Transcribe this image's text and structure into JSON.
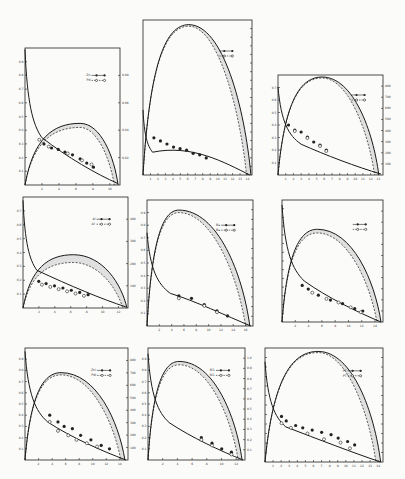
{
  "figure": {
    "background": "#fbfbf9",
    "ink": "#1a1a1a",
    "band_color": "#d9d9d9"
  },
  "chart_data": [
    {
      "id": "p1",
      "type": "line",
      "box": {
        "x": 25,
        "y": 48,
        "w": 95,
        "h": 137
      },
      "legend": [
        {
          "marker": "filled",
          "label": "Zn —●—●"
        },
        {
          "marker": "open",
          "label": "Pd —○—○"
        }
      ],
      "x_ticks": [
        "2",
        "4",
        "6",
        "8",
        "10"
      ],
      "left_ticks": [
        "0.1",
        "0.2",
        "0.3",
        "0.4",
        "0.5",
        "0.6",
        "0.7",
        "0.8",
        "0.9"
      ],
      "right_ticks": [
        "0.02",
        "0.04",
        "0.06",
        "0.08"
      ],
      "peak_curve": {
        "peak_x": 0.58,
        "peak_y": 0.45,
        "dash_peak_y": 0.42,
        "end_x": 0.98
      },
      "decay_curve": {
        "start_y": 0.99,
        "knee": 0.08,
        "end_y": 0.01
      },
      "points_filled": [
        [
          0.2,
          0.3
        ],
        [
          0.28,
          0.27
        ],
        [
          0.35,
          0.26
        ],
        [
          0.42,
          0.24
        ],
        [
          0.5,
          0.22
        ],
        [
          0.58,
          0.19
        ],
        [
          0.65,
          0.16
        ],
        [
          0.72,
          0.13
        ]
      ],
      "points_open": [
        [
          0.15,
          0.33
        ],
        [
          0.25,
          0.28
        ],
        [
          0.45,
          0.23
        ],
        [
          0.6,
          0.18
        ],
        [
          0.7,
          0.15
        ]
      ]
    },
    {
      "id": "p2",
      "type": "line",
      "box": {
        "x": 143,
        "y": 20,
        "w": 109,
        "h": 155
      },
      "legend": [
        {
          "marker": "filled",
          "label": "—●"
        },
        {
          "marker": "open",
          "label": "—●"
        }
      ],
      "x_ticks": [
        "1",
        "2",
        "3",
        "4",
        "5",
        "6",
        "7",
        "8",
        "9",
        "10",
        "11",
        "12",
        "13",
        "14"
      ],
      "left_ticks": [],
      "right_ticks": [
        "",
        "",
        "",
        "",
        "",
        "",
        "",
        "",
        "",
        "",
        "",
        "",
        "",
        "",
        "",
        "",
        ""
      ],
      "peak_curve": {
        "peak_x": 0.42,
        "peak_y": 0.97,
        "dash_peak_y": 0.96,
        "end_x": 0.99
      },
      "decay_curve": {
        "start_y": 0.42,
        "knee": 0.04,
        "end_y": 0.0
      },
      "points_filled": [
        [
          0.1,
          0.24
        ],
        [
          0.16,
          0.22
        ],
        [
          0.22,
          0.2
        ],
        [
          0.28,
          0.18
        ],
        [
          0.34,
          0.17
        ],
        [
          0.4,
          0.16
        ],
        [
          0.46,
          0.14
        ],
        [
          0.52,
          0.13
        ],
        [
          0.58,
          0.11
        ]
      ],
      "points_open": []
    },
    {
      "id": "p3",
      "type": "line",
      "box": {
        "x": 278,
        "y": 75,
        "w": 105,
        "h": 100
      },
      "legend": [
        {
          "marker": "filled",
          "label": "—●—●"
        },
        {
          "marker": "open",
          "label": "—○—○"
        }
      ],
      "x_ticks": [
        "1",
        "2",
        "3",
        "4",
        "5",
        "6",
        "7",
        "8",
        "9",
        "10",
        "11",
        "12",
        "13"
      ],
      "left_ticks": [
        "0.1",
        "0.2",
        "0.3",
        "0.4",
        "0.5",
        "0.6",
        "0.7"
      ],
      "right_ticks": [
        "100",
        "200",
        "300",
        "400",
        "500",
        "600",
        "700",
        "800"
      ],
      "peak_curve": {
        "peak_x": 0.42,
        "peak_y": 0.98,
        "dash_peak_y": 0.97,
        "end_x": 0.96
      },
      "decay_curve": {
        "start_y": 0.88,
        "knee": 0.1,
        "end_y": 0.01
      },
      "points_filled": [
        [
          0.1,
          0.5
        ],
        [
          0.16,
          0.45
        ],
        [
          0.22,
          0.43
        ],
        [
          0.28,
          0.38
        ],
        [
          0.34,
          0.33
        ],
        [
          0.4,
          0.3
        ],
        [
          0.46,
          0.25
        ]
      ],
      "points_open": [
        [
          0.16,
          0.44
        ],
        [
          0.28,
          0.37
        ],
        [
          0.4,
          0.29
        ],
        [
          0.46,
          0.24
        ]
      ]
    },
    {
      "id": "p4",
      "type": "line",
      "box": {
        "x": 23,
        "y": 197,
        "w": 105,
        "h": 111
      },
      "legend": [
        {
          "marker": "filled",
          "label": "Al —●—●"
        },
        {
          "marker": "open",
          "label": "Al' —○—○"
        }
      ],
      "x_ticks": [
        "2",
        "4",
        "6",
        "8",
        "10",
        "12"
      ],
      "left_ticks": [
        "0.1",
        "0.2",
        "0.3",
        "0.4",
        "0.5",
        "0.6",
        "0.7"
      ],
      "right_ticks": [
        "100",
        "200",
        "300",
        "400"
      ],
      "peak_curve": {
        "peak_x": 0.48,
        "peak_y": 0.48,
        "dash_peak_y": 0.41,
        "end_x": 0.99
      },
      "decay_curve": {
        "start_y": 0.97,
        "knee": 0.06,
        "end_y": 0.01
      },
      "points_filled": [
        [
          0.15,
          0.24
        ],
        [
          0.22,
          0.22
        ],
        [
          0.3,
          0.2
        ],
        [
          0.38,
          0.18
        ],
        [
          0.46,
          0.16
        ],
        [
          0.54,
          0.14
        ],
        [
          0.62,
          0.12
        ]
      ],
      "points_open": [
        [
          0.18,
          0.21
        ],
        [
          0.26,
          0.19
        ],
        [
          0.34,
          0.17
        ],
        [
          0.42,
          0.15
        ],
        [
          0.5,
          0.13
        ],
        [
          0.58,
          0.11
        ]
      ]
    },
    {
      "id": "p5",
      "type": "line",
      "box": {
        "x": 147,
        "y": 200,
        "w": 106,
        "h": 126
      },
      "legend": [
        {
          "marker": "filled",
          "label": "Ba —●—●"
        },
        {
          "marker": "open",
          "label": "Ba —○—○"
        }
      ],
      "x_ticks": [
        "2",
        "4",
        "6",
        "8",
        "10",
        "12",
        "14",
        "16"
      ],
      "left_ticks": [
        "0.1",
        "0.2",
        "0.3",
        "0.4",
        "0.5",
        "0.6",
        "0.7",
        "0.8",
        "0.9"
      ],
      "right_ticks": [
        "",
        "",
        "",
        "",
        "",
        "",
        "",
        "",
        "",
        "",
        "",
        ""
      ],
      "peak_curve": {
        "peak_x": 0.3,
        "peak_y": 0.92,
        "dash_peak_y": 0.9,
        "end_x": 0.97
      },
      "decay_curve": {
        "start_y": 0.74,
        "knee": 0.1,
        "end_y": 0.0
      },
      "points_filled": [
        [
          0.3,
          0.24
        ],
        [
          0.42,
          0.22
        ],
        [
          0.54,
          0.17
        ],
        [
          0.66,
          0.12
        ],
        [
          0.76,
          0.08
        ]
      ],
      "points_open": [
        [
          0.3,
          0.22
        ],
        [
          0.54,
          0.16
        ],
        [
          0.66,
          0.11
        ]
      ]
    },
    {
      "id": "p6",
      "type": "line",
      "box": {
        "x": 282,
        "y": 200,
        "w": 101,
        "h": 122
      },
      "legend": [
        {
          "marker": "filled",
          "label": "—●—●"
        },
        {
          "marker": "open",
          "label": "—○—○"
        }
      ],
      "x_ticks": [
        "2",
        "4",
        "6",
        "8",
        "10",
        "12",
        "14"
      ],
      "left_ticks": [
        "",
        "",
        "",
        "",
        "",
        "",
        "",
        "",
        "",
        "",
        "",
        "",
        ""
      ],
      "right_ticks": [
        "",
        "",
        "",
        "",
        "",
        "",
        "",
        "",
        "",
        ""
      ],
      "peak_curve": {
        "peak_x": 0.35,
        "peak_y": 0.76,
        "dash_peak_y": 0.73,
        "end_x": 0.98
      },
      "decay_curve": {
        "start_y": 0.96,
        "knee": 0.1,
        "end_y": 0.0
      },
      "points_filled": [
        [
          0.2,
          0.3
        ],
        [
          0.26,
          0.27
        ],
        [
          0.36,
          0.22
        ],
        [
          0.48,
          0.18
        ],
        [
          0.6,
          0.15
        ],
        [
          0.72,
          0.11
        ],
        [
          0.8,
          0.09
        ]
      ],
      "points_open": [
        [
          0.3,
          0.24
        ],
        [
          0.44,
          0.19
        ],
        [
          0.56,
          0.16
        ],
        [
          0.68,
          0.12
        ],
        [
          0.78,
          0.08
        ]
      ]
    },
    {
      "id": "p7",
      "type": "line",
      "box": {
        "x": 25,
        "y": 348,
        "w": 103,
        "h": 112
      },
      "legend": [
        {
          "marker": "filled",
          "label": "ZnI —●—●"
        },
        {
          "marker": "open",
          "label": "PdI —○—○"
        }
      ],
      "x_ticks": [
        "2",
        "4",
        "6",
        "8",
        "10",
        "12",
        "14"
      ],
      "left_ticks": [
        "0.1",
        "0.2",
        "0.3",
        "0.4",
        "0.5",
        "0.6",
        "0.7",
        "0.8",
        "0.9"
      ],
      "right_ticks": [
        "100",
        "200",
        "300",
        "400",
        "500",
        "600",
        "700",
        "800"
      ],
      "peak_curve": {
        "peak_x": 0.35,
        "peak_y": 0.78,
        "dash_peak_y": 0.76,
        "end_x": 0.97
      },
      "decay_curve": {
        "start_y": 0.97,
        "knee": 0.1,
        "end_y": 0.0
      },
      "points_filled": [
        [
          0.24,
          0.4
        ],
        [
          0.32,
          0.34
        ],
        [
          0.38,
          0.3
        ],
        [
          0.46,
          0.28
        ],
        [
          0.54,
          0.22
        ],
        [
          0.64,
          0.18
        ],
        [
          0.74,
          0.13
        ],
        [
          0.82,
          0.1
        ]
      ],
      "points_open": [
        [
          0.24,
          0.34
        ],
        [
          0.32,
          0.26
        ],
        [
          0.42,
          0.22
        ],
        [
          0.5,
          0.18
        ],
        [
          0.6,
          0.15
        ],
        [
          0.7,
          0.12
        ]
      ]
    },
    {
      "id": "p8",
      "type": "line",
      "box": {
        "x": 148,
        "y": 348,
        "w": 97,
        "h": 112
      },
      "legend": [
        {
          "marker": "filled",
          "label": "Bi1 —●—●"
        },
        {
          "marker": "open",
          "label": "Bi1 —○—○"
        }
      ],
      "x_ticks": [
        "2",
        "4",
        "6",
        "8",
        "10",
        "12"
      ],
      "left_ticks": [
        "0.1",
        "0.2",
        "0.3",
        "0.4",
        "0.5",
        "0.6",
        "0.7",
        "0.8",
        "0.9"
      ],
      "right_ticks": [
        "0.1",
        "0.2",
        "0.3",
        "0.4",
        "0.5",
        "0.6",
        "0.7",
        "0.8",
        "0.9",
        "1.0"
      ],
      "peak_curve": {
        "peak_x": 0.32,
        "peak_y": 0.88,
        "dash_peak_y": 0.85,
        "end_x": 0.97
      },
      "decay_curve": {
        "start_y": 0.95,
        "knee": 0.1,
        "end_y": 0.0
      },
      "points_filled": [
        [
          0.55,
          0.2
        ],
        [
          0.66,
          0.15
        ],
        [
          0.76,
          0.1
        ],
        [
          0.86,
          0.07
        ]
      ],
      "points_open": [
        [
          0.55,
          0.18
        ],
        [
          0.66,
          0.13
        ],
        [
          0.86,
          0.05
        ]
      ]
    },
    {
      "id": "p9",
      "type": "line",
      "box": {
        "x": 265,
        "y": 348,
        "w": 118,
        "h": 114
      },
      "legend": [
        {
          "marker": "filled",
          "label": "PT —●—●"
        },
        {
          "marker": "open",
          "label": "PT —○—○"
        }
      ],
      "x_ticks": [
        "1",
        "2",
        "3",
        "4",
        "5",
        "6",
        "7",
        "8",
        "9",
        "10",
        "11",
        "12",
        "13",
        "14"
      ],
      "left_ticks": [
        "",
        "",
        "",
        "",
        "",
        "",
        "",
        "",
        "",
        "",
        ""
      ],
      "right_ticks": [
        "",
        "",
        "",
        "",
        "",
        "",
        "",
        "",
        "",
        "",
        ""
      ],
      "peak_curve": {
        "peak_x": 0.45,
        "peak_y": 0.97,
        "dash_peak_y": 0.96,
        "end_x": 0.98
      },
      "decay_curve": {
        "start_y": 0.88,
        "knee": 0.08,
        "end_y": 0.0
      },
      "points_filled": [
        [
          0.14,
          0.4
        ],
        [
          0.18,
          0.36
        ],
        [
          0.26,
          0.32
        ],
        [
          0.32,
          0.3
        ],
        [
          0.4,
          0.28
        ],
        [
          0.48,
          0.26
        ],
        [
          0.56,
          0.24
        ],
        [
          0.62,
          0.21
        ],
        [
          0.7,
          0.18
        ],
        [
          0.76,
          0.15
        ]
      ],
      "points_open": [
        [
          0.14,
          0.34
        ],
        [
          0.22,
          0.3
        ],
        [
          0.36,
          0.25
        ],
        [
          0.5,
          0.2
        ],
        [
          0.64,
          0.17
        ],
        [
          0.72,
          0.12
        ]
      ]
    }
  ]
}
